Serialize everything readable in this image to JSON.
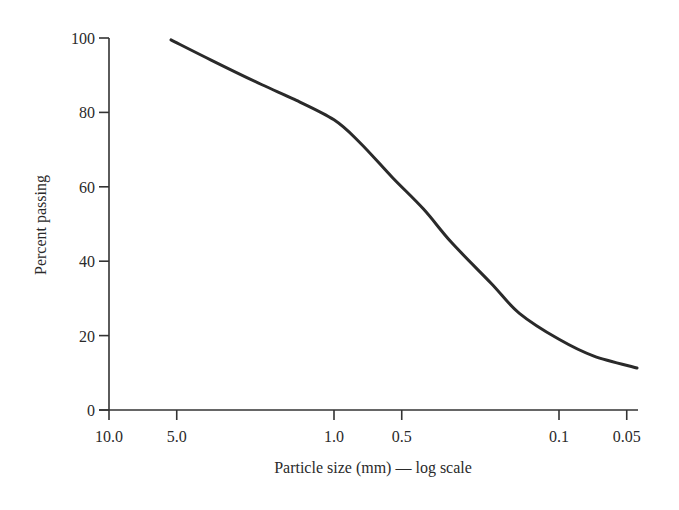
{
  "chart_data": {
    "type": "line",
    "title": "",
    "xlabel": "Particle size (mm) — log scale",
    "ylabel": "Percent passing",
    "x_scale": "log",
    "x_reversed": true,
    "xlim": [
      10.0,
      0.05
    ],
    "ylim": [
      0,
      100
    ],
    "grid": false,
    "x_ticks": [
      "10.0",
      "5.0",
      "1.0",
      "0.5",
      "0.1",
      "0.05"
    ],
    "x_tick_values": [
      10.0,
      5.0,
      1.0,
      0.5,
      0.1,
      0.05
    ],
    "y_ticks": [
      "0",
      "20",
      "40",
      "60",
      "80",
      "100"
    ],
    "y_tick_values": [
      0,
      20,
      40,
      60,
      80,
      100
    ],
    "series": [
      {
        "name": "Grain size distribution",
        "color": "#2a2a2a",
        "x": [
          5.3,
          3.5,
          2.1,
          1.5,
          1.0,
          0.77,
          0.55,
          0.4,
          0.3,
          0.2,
          0.15,
          0.1,
          0.07,
          0.045
        ],
        "y": [
          99.5,
          94,
          87.5,
          83.5,
          78,
          72,
          62.5,
          54,
          45,
          34,
          26,
          19,
          14.5,
          11.3
        ]
      }
    ]
  }
}
